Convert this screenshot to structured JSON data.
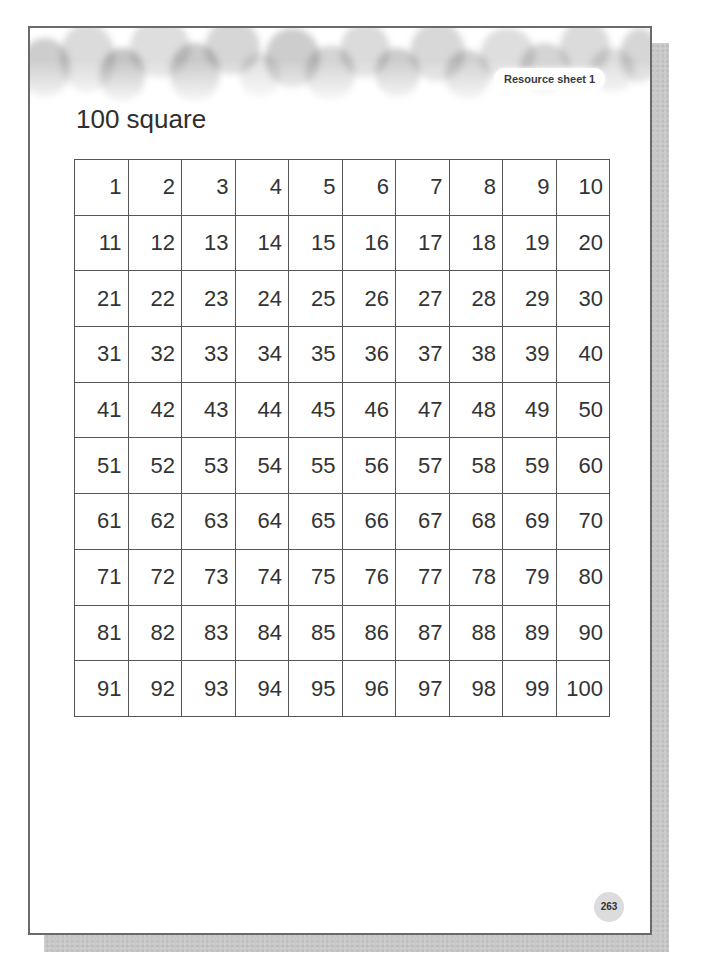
{
  "cutoff_heading": "",
  "header": {
    "badge_label": "Resource sheet 1"
  },
  "title": "100 square",
  "grid": {
    "rows": [
      [
        "1",
        "2",
        "3",
        "4",
        "5",
        "6",
        "7",
        "8",
        "9",
        "10"
      ],
      [
        "11",
        "12",
        "13",
        "14",
        "15",
        "16",
        "17",
        "18",
        "19",
        "20"
      ],
      [
        "21",
        "22",
        "23",
        "24",
        "25",
        "26",
        "27",
        "28",
        "29",
        "30"
      ],
      [
        "31",
        "32",
        "33",
        "34",
        "35",
        "36",
        "37",
        "38",
        "39",
        "40"
      ],
      [
        "41",
        "42",
        "43",
        "44",
        "45",
        "46",
        "47",
        "48",
        "49",
        "50"
      ],
      [
        "51",
        "52",
        "53",
        "54",
        "55",
        "56",
        "57",
        "58",
        "59",
        "60"
      ],
      [
        "61",
        "62",
        "63",
        "64",
        "65",
        "66",
        "67",
        "68",
        "69",
        "70"
      ],
      [
        "71",
        "72",
        "73",
        "74",
        "75",
        "76",
        "77",
        "78",
        "79",
        "80"
      ],
      [
        "81",
        "82",
        "83",
        "84",
        "85",
        "86",
        "87",
        "88",
        "89",
        "90"
      ],
      [
        "91",
        "92",
        "93",
        "94",
        "95",
        "96",
        "97",
        "98",
        "99",
        "100"
      ]
    ]
  },
  "footer": {
    "page_number": "263"
  },
  "colors": {
    "page_border": "#6a6a6a",
    "shadow": "#c8c8c8",
    "grid_line": "#555555",
    "text": "#333333",
    "page_number_bg": "#dcdcdc"
  }
}
